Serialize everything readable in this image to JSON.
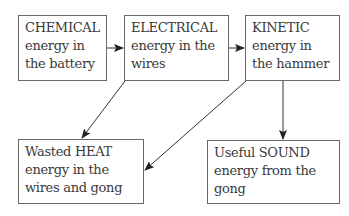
{
  "diagram": {
    "type": "energy-transfer-flowchart",
    "nodes": [
      {
        "id": "chemical",
        "lines": [
          "CHEMICAL",
          "energy in",
          "the battery"
        ]
      },
      {
        "id": "electrical",
        "lines": [
          "ELECTRICAL",
          "energy in the",
          "wires"
        ]
      },
      {
        "id": "kinetic",
        "lines": [
          "KINETIC",
          "energy in",
          "the hammer"
        ]
      },
      {
        "id": "heat",
        "lines": [
          "Wasted HEAT",
          "energy in the",
          "wires and gong"
        ]
      },
      {
        "id": "sound",
        "lines": [
          "Useful SOUND",
          "energy from the",
          "gong"
        ]
      }
    ],
    "edges": [
      {
        "from": "chemical",
        "to": "electrical"
      },
      {
        "from": "electrical",
        "to": "kinetic"
      },
      {
        "from": "electrical",
        "to": "heat"
      },
      {
        "from": "kinetic",
        "to": "heat"
      },
      {
        "from": "kinetic",
        "to": "sound"
      }
    ],
    "colors": {
      "border": "#6a6a6a",
      "text": "#3a3a3a",
      "arrow": "#333333",
      "background": "#ffffff"
    }
  }
}
